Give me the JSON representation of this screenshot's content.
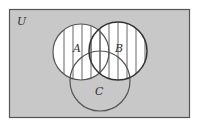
{
  "diagram": {
    "type": "venn",
    "universe_label": "U",
    "sets": [
      {
        "id": "A",
        "label": "A"
      },
      {
        "id": "B",
        "label": "B"
      },
      {
        "id": "C",
        "label": "C"
      }
    ],
    "shaded_region": "A ∪ B",
    "shading_style": "vertical-stripes",
    "colors": {
      "background": "#c8c8c8",
      "shaded_fill": "#ffffff",
      "stripe": "#555555",
      "border": "#555555",
      "circle_outline": "#555555",
      "label": "#333333"
    }
  }
}
